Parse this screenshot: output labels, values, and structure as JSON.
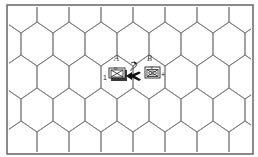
{
  "diagram": {
    "type": "hex-map-movement-example",
    "frame": {
      "x": 7,
      "y": 5,
      "width": 246,
      "height": 149,
      "border_color": "#6e6e6e"
    },
    "grid": {
      "orientation": "pointy-top",
      "hex_width": 32,
      "row_spacing": 33,
      "line_color": "#7a7a7a"
    },
    "hex_labels": [
      {
        "id": "A",
        "text": "A",
        "x": 114,
        "y": 61
      },
      {
        "id": "B",
        "text": "B",
        "x": 147,
        "y": 61
      }
    ],
    "units": [
      {
        "id": "unit-a",
        "hex": "A",
        "kind": "infantry-stack",
        "size_marker": "III",
        "side_mark": "1",
        "x": 109,
        "y": 67
      },
      {
        "id": "unit-b",
        "hex": "B",
        "kind": "armored-infantry",
        "size_marker": "II",
        "side_mark": "+",
        "x": 145,
        "y": 67
      }
    ],
    "arrows": [
      {
        "id": "retreat-arrow",
        "style": "solid",
        "direction": "left",
        "from_hex": "B",
        "to_hex": "A"
      },
      {
        "id": "rotation-arrow",
        "style": "curved",
        "direction": "clockwise"
      }
    ]
  }
}
